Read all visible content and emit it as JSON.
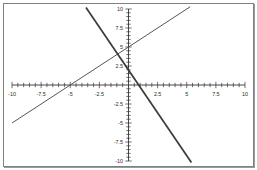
{
  "chart_data": {
    "type": "line",
    "title": "",
    "xlabel": "",
    "ylabel": "",
    "xlim": [
      -10,
      10
    ],
    "ylim": [
      -10,
      10
    ],
    "grid": false,
    "legend": "none",
    "axis_style": "cartesian-cross",
    "x_ticks_labeled": [
      -10,
      -7.5,
      -5,
      -2.5,
      2.5,
      5,
      7.5,
      10
    ],
    "y_ticks_labeled": [
      10,
      7.5,
      5,
      2.5,
      -2.5,
      -5,
      -7.5,
      -10
    ],
    "tick_minor_interval": 0.5,
    "x_tick_labels": [
      "-10",
      "-7.5",
      "-5",
      "-2.5",
      "2.5",
      "5",
      "7.5",
      "10"
    ],
    "y_tick_labels": [
      "10",
      "7.5",
      "5",
      "2.5",
      "-2.5",
      "-5",
      "-7.5",
      "-10"
    ],
    "series": [
      {
        "name": "ascending-line",
        "equation": "y = x + 5",
        "slope": 1,
        "intercept": 5,
        "x_intercept": -5,
        "y_intercept": 5,
        "color": "#555555",
        "width": 1,
        "points": [
          [
            -10,
            -5
          ],
          [
            5.3,
            10.3
          ]
        ]
      },
      {
        "name": "descending-line",
        "equation": "y = -2.25x + 2",
        "slope": -2.25,
        "intercept": 2,
        "x_intercept": 0.89,
        "y_intercept": 2,
        "color": "#3a3a3a",
        "width": 1.7,
        "points": [
          [
            -3.65,
            10.2
          ],
          [
            5.4,
            -10.2
          ]
        ]
      }
    ],
    "intersection": [
      -0.92,
      4.08
    ]
  },
  "axis_colors": {
    "axis": "#333333",
    "frame": "#808080",
    "background": "#ffffff"
  }
}
